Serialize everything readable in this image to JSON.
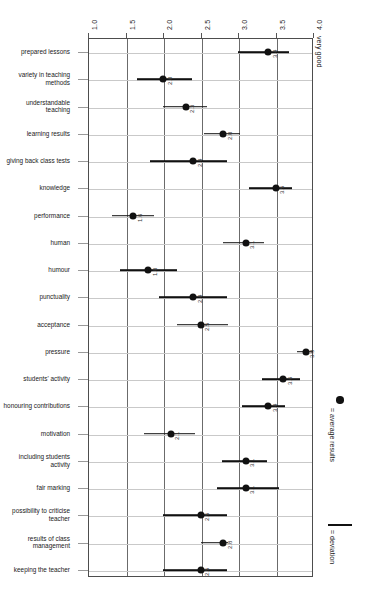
{
  "chart_data": {
    "type": "scatter",
    "title": "",
    "xlabel": "",
    "ylabel": "",
    "orientation": "rotated-90",
    "axis_caption": "very good",
    "xlim": [
      1.0,
      4.0
    ],
    "xticks": [
      "1.0",
      "1.5",
      "2.0",
      "2.5",
      "3.0",
      "3.5",
      "4.0"
    ],
    "xtick_values": [
      1.0,
      1.5,
      2.0,
      2.5,
      3.0,
      3.5,
      4.0
    ],
    "grid": "both",
    "legend_position": "right",
    "legend": [
      {
        "marker": "dot",
        "label": "= average results"
      },
      {
        "marker": "line",
        "label": "= deviation"
      }
    ],
    "categories": [
      "prepared lessons",
      "variety in teaching methods",
      "understandable teaching",
      "learning results",
      "giving back class tests",
      "knowledge",
      "performance",
      "human",
      "humour",
      "punctuality",
      "acceptance",
      "pressure",
      "students' activity",
      "honouring contributions",
      "motivation",
      "including students activity",
      "fair marking",
      "possibility to criticise teacher",
      "results of class management",
      "keeping the teacher"
    ],
    "category_lines": [
      [
        "prepared lessons"
      ],
      [
        "variety in teaching",
        "methods"
      ],
      [
        "understandable",
        "teaching"
      ],
      [
        "learning results"
      ],
      [
        "giving back class tests"
      ],
      [
        "knowledge"
      ],
      [
        "performance"
      ],
      [
        "human"
      ],
      [
        "humour"
      ],
      [
        "punctuality"
      ],
      [
        "acceptance"
      ],
      [
        "pressure"
      ],
      [
        "students' activity"
      ],
      [
        "honouring contributions"
      ],
      [
        "motivation"
      ],
      [
        "including students",
        "activity"
      ],
      [
        "fair marking"
      ],
      [
        "possibility to criticise",
        "teacher"
      ],
      [
        "results of class",
        "management"
      ],
      [
        "keeping the teacher"
      ]
    ],
    "values": [
      3.4,
      2.0,
      2.3,
      2.8,
      2.4,
      3.5,
      1.6,
      3.1,
      1.8,
      2.4,
      2.5,
      3.9,
      3.6,
      3.4,
      2.1,
      3.1,
      3.1,
      2.5,
      2.8,
      2.5
    ],
    "value_labels": [
      "3.4",
      "2.0",
      "2.3",
      "2.8",
      "2.4",
      "3.5",
      "1.6",
      "3.1",
      "1.8",
      "2.4",
      "2.5",
      "3.9",
      "3.6",
      "3.4",
      "2.1",
      "3.1",
      "3.1",
      "2.5",
      "2.8",
      "2.5"
    ],
    "deviation_low": [
      3.0,
      1.65,
      2.0,
      2.55,
      1.82,
      3.15,
      1.32,
      2.8,
      1.43,
      1.95,
      2.18,
      3.78,
      3.32,
      3.05,
      1.75,
      2.78,
      2.72,
      2.0,
      2.5,
      2.0
    ],
    "deviation_high": [
      3.68,
      2.38,
      2.58,
      3.03,
      2.85,
      3.72,
      1.88,
      3.34,
      2.18,
      2.85,
      2.86,
      4.0,
      3.82,
      3.62,
      2.43,
      3.38,
      3.55,
      2.85,
      2.86,
      2.85
    ]
  },
  "legend": {
    "average_label": "= average results",
    "deviation_label": "= deviation"
  }
}
